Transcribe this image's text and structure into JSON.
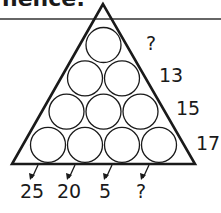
{
  "header": {
    "title_fragment": "nence:"
  },
  "diagram": {
    "rows": [
      1,
      2,
      3,
      4
    ],
    "right_labels": [
      "?",
      "13",
      "15",
      "17"
    ],
    "bottom_labels": [
      "25",
      "20",
      "5",
      "?"
    ],
    "colors": {
      "stroke": "#1a1a1a",
      "background": "#ffffff"
    }
  }
}
